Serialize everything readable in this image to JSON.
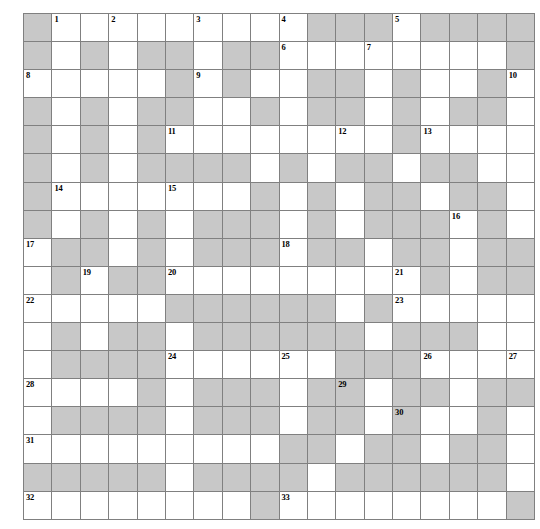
{
  "puzzle": {
    "type": "crossword-grid",
    "rows": 18,
    "cols": 18,
    "colors": {
      "block_fill": "#c8c8c8",
      "open_fill": "#ffffff",
      "grid_line": "#808080",
      "number_color": "#000000"
    },
    "cell_size_px": 27,
    "grid": [
      [
        1,
        0,
        0,
        0,
        0,
        0,
        0,
        0,
        0,
        0,
        1,
        1,
        1,
        0,
        1,
        1,
        1,
        1
      ],
      [
        1,
        0,
        1,
        0,
        1,
        1,
        0,
        1,
        1,
        0,
        0,
        0,
        0,
        0,
        0,
        0,
        0,
        1
      ],
      [
        0,
        0,
        0,
        0,
        0,
        1,
        0,
        1,
        0,
        0,
        1,
        1,
        0,
        1,
        0,
        0,
        1,
        0
      ],
      [
        1,
        0,
        1,
        0,
        1,
        1,
        0,
        0,
        1,
        0,
        1,
        1,
        0,
        1,
        0,
        1,
        1,
        0
      ],
      [
        1,
        0,
        1,
        0,
        1,
        0,
        0,
        0,
        0,
        0,
        0,
        0,
        0,
        1,
        0,
        0,
        0,
        0
      ],
      [
        1,
        0,
        1,
        0,
        1,
        1,
        1,
        1,
        0,
        1,
        0,
        1,
        1,
        0,
        1,
        1,
        0,
        0
      ],
      [
        1,
        0,
        0,
        0,
        0,
        0,
        0,
        0,
        1,
        0,
        1,
        0,
        1,
        1,
        0,
        1,
        1,
        0
      ],
      [
        1,
        0,
        1,
        0,
        1,
        0,
        1,
        1,
        1,
        0,
        1,
        0,
        1,
        1,
        1,
        0,
        1,
        0
      ],
      [
        0,
        1,
        1,
        0,
        1,
        0,
        1,
        1,
        1,
        0,
        1,
        1,
        0,
        1,
        1,
        0,
        1,
        1
      ],
      [
        0,
        1,
        0,
        1,
        1,
        0,
        0,
        0,
        0,
        0,
        0,
        0,
        0,
        0,
        1,
        0,
        1,
        1
      ],
      [
        0,
        0,
        0,
        0,
        0,
        1,
        1,
        1,
        1,
        1,
        1,
        0,
        1,
        0,
        0,
        0,
        0,
        0
      ],
      [
        0,
        1,
        0,
        1,
        1,
        0,
        1,
        1,
        1,
        1,
        1,
        1,
        0,
        1,
        1,
        1,
        0,
        0
      ],
      [
        0,
        1,
        1,
        1,
        1,
        0,
        0,
        0,
        0,
        0,
        0,
        1,
        1,
        1,
        0,
        0,
        0,
        0
      ],
      [
        0,
        0,
        0,
        0,
        1,
        0,
        1,
        1,
        1,
        0,
        1,
        1,
        0,
        1,
        1,
        0,
        1,
        1
      ],
      [
        0,
        1,
        1,
        1,
        1,
        0,
        1,
        1,
        1,
        0,
        1,
        1,
        0,
        1,
        0,
        0,
        1,
        0
      ],
      [
        0,
        0,
        0,
        0,
        0,
        0,
        0,
        0,
        0,
        1,
        1,
        0,
        1,
        1,
        0,
        1,
        1,
        0
      ],
      [
        1,
        1,
        1,
        1,
        1,
        0,
        1,
        1,
        1,
        1,
        0,
        1,
        1,
        1,
        1,
        1,
        1,
        0
      ],
      [
        0,
        0,
        0,
        0,
        0,
        0,
        0,
        0,
        1,
        0,
        0,
        0,
        0,
        0,
        0,
        0,
        0,
        1
      ]
    ],
    "numbers": [
      {
        "n": "1",
        "row": 0,
        "col": 1
      },
      {
        "n": "2",
        "row": 0,
        "col": 3
      },
      {
        "n": "3",
        "row": 0,
        "col": 6
      },
      {
        "n": "4",
        "row": 0,
        "col": 9
      },
      {
        "n": "5",
        "row": 0,
        "col": 13
      },
      {
        "n": "6",
        "row": 1,
        "col": 9
      },
      {
        "n": "7",
        "row": 1,
        "col": 12
      },
      {
        "n": "8",
        "row": 2,
        "col": 0
      },
      {
        "n": "9",
        "row": 2,
        "col": 6
      },
      {
        "n": "10",
        "row": 2,
        "col": 17
      },
      {
        "n": "11",
        "row": 4,
        "col": 5
      },
      {
        "n": "12",
        "row": 4,
        "col": 11
      },
      {
        "n": "13",
        "row": 4,
        "col": 14
      },
      {
        "n": "14",
        "row": 6,
        "col": 1
      },
      {
        "n": "15",
        "row": 6,
        "col": 5
      },
      {
        "n": "16",
        "row": 7,
        "col": 15
      },
      {
        "n": "17",
        "row": 8,
        "col": 0
      },
      {
        "n": "18",
        "row": 8,
        "col": 9
      },
      {
        "n": "19",
        "row": 9,
        "col": 2
      },
      {
        "n": "20",
        "row": 9,
        "col": 5
      },
      {
        "n": "21",
        "row": 9,
        "col": 13
      },
      {
        "n": "22",
        "row": 10,
        "col": 0
      },
      {
        "n": "23",
        "row": 10,
        "col": 13
      },
      {
        "n": "24",
        "row": 12,
        "col": 5
      },
      {
        "n": "25",
        "row": 12,
        "col": 9
      },
      {
        "n": "26",
        "row": 12,
        "col": 14
      },
      {
        "n": "27",
        "row": 12,
        "col": 17
      },
      {
        "n": "28",
        "row": 13,
        "col": 0
      },
      {
        "n": "29",
        "row": 13,
        "col": 11
      },
      {
        "n": "30",
        "row": 14,
        "col": 13
      },
      {
        "n": "31",
        "row": 15,
        "col": 0
      },
      {
        "n": "32",
        "row": 17,
        "col": 0
      },
      {
        "n": "33",
        "row": 17,
        "col": 9
      }
    ]
  }
}
